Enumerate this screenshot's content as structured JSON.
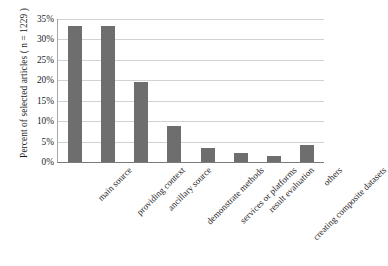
{
  "chart_data": {
    "type": "bar",
    "title": "",
    "subtitle": "",
    "xlabel": "",
    "ylabel": "Percent of  selected articles ( n = 1229 )",
    "ylim": [
      0,
      35
    ],
    "grid": true,
    "legend": "none",
    "value_suffix": "%",
    "categories": [
      "main source",
      "providing context",
      "ancillary source",
      "demonstrate methods",
      "services or platforms",
      "result evaluation",
      "creating composite datasets",
      "others"
    ],
    "values": [
      33.2,
      33.2,
      19.6,
      8.8,
      3.4,
      2.2,
      1.4,
      4.1
    ],
    "ytick_labels": [
      "35%",
      "30%",
      "25%",
      "20%",
      "15%",
      "10%",
      "5%",
      "0%"
    ],
    "ytick_values": [
      35,
      30,
      25,
      20,
      15,
      10,
      5,
      0
    ],
    "colors": {
      "bar": "#6e6e6e",
      "gridline": "#d2d2d2",
      "axis": "#7a7a7a",
      "text": "#1d1d1d",
      "background": "#ffffff"
    }
  }
}
